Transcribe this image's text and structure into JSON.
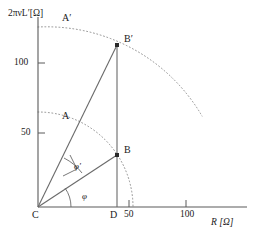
{
  "figure": {
    "axes": {
      "y_axis_label": "2πνL′[Ω]",
      "x_axis_label": "R [Ω]",
      "y_ticks": [
        {
          "label": "50",
          "value": 50
        },
        {
          "label": "100",
          "value": 100
        }
      ],
      "x_ticks": [
        {
          "label": "50",
          "value": 50
        },
        {
          "label": "100",
          "value": 100
        }
      ]
    },
    "points": [
      {
        "name": "C",
        "label": "C",
        "x": 0,
        "y": 0
      },
      {
        "name": "D",
        "label": "D",
        "x": 45,
        "y": 0
      },
      {
        "name": "A",
        "label": "A",
        "x": 0,
        "y": 54
      },
      {
        "name": "A-prime",
        "label": "A′",
        "x": 0,
        "y": 103
      },
      {
        "name": "B",
        "label": "B",
        "x": 45,
        "y": 30
      },
      {
        "name": "B-prime",
        "label": "B′",
        "x": 45,
        "y": 92
      }
    ],
    "angles": [
      {
        "name": "phi",
        "label": "φ",
        "vertex": "C",
        "between": [
          "C-D",
          "C-B"
        ]
      },
      {
        "name": "phi-prime",
        "label": "φ′",
        "vertex": "C",
        "between": [
          "C-B",
          "C-B-prime"
        ]
      }
    ],
    "arcs": [
      {
        "name": "inner-arc",
        "center": "C",
        "radius": 54,
        "from": "A",
        "to": "x-axis",
        "style": "dotted"
      },
      {
        "name": "outer-arc",
        "center": "C",
        "radius": 103,
        "from": "A-prime",
        "to": "lower-right",
        "style": "dotted"
      }
    ],
    "lines": [
      {
        "name": "line-c-b",
        "from": "C",
        "to": "B",
        "style": "solid"
      },
      {
        "name": "line-c-b-prime",
        "from": "C",
        "to": "B-prime",
        "style": "solid"
      },
      {
        "name": "line-d-vertical",
        "from": "D",
        "to": "B-prime",
        "style": "solid"
      }
    ],
    "colors": {
      "stroke": "#4a4a4a",
      "text": "#1a1a1a",
      "dotted": "#8a8a8a"
    }
  }
}
